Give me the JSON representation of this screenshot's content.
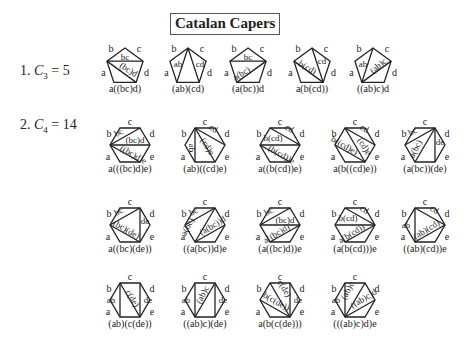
{
  "title": "Catalan Capers",
  "sections": [
    {
      "number": "1.",
      "symbol": "C",
      "subscript": "3",
      "equals": "= 5",
      "y": 70
    },
    {
      "number": "2.",
      "symbol": "C",
      "subscript": "4",
      "equals": "= 14",
      "y": 150
    }
  ],
  "edge_labels": {
    "pentagon": [
      "b",
      "c",
      "d",
      "a"
    ],
    "hexagon": [
      "b",
      "c",
      "d",
      "e",
      "a"
    ]
  },
  "colors": {
    "stroke": "#222222",
    "text": "#222222",
    "background": "#ffffff"
  },
  "pentagons": [
    {
      "cx": 125,
      "cy": 65,
      "caption": "a((bc)d)",
      "diagonals": [
        [
          4,
          1
        ],
        [
          4,
          2
        ]
      ],
      "inner_labels": [
        {
          "text": "bc",
          "x": 125,
          "y": 60,
          "rot": 0
        },
        {
          "text": "(bc)d",
          "x": 127,
          "y": 72,
          "rot": 32
        }
      ]
    },
    {
      "cx": 188,
      "cy": 65,
      "caption": "(ab)(cd)",
      "diagonals": [
        [
          0,
          3
        ],
        [
          0,
          2
        ]
      ],
      "inner_labels": [
        {
          "text": "ab",
          "x": 178,
          "y": 67,
          "rot": 0
        },
        {
          "text": "cd",
          "x": 200,
          "y": 67,
          "rot": 0
        }
      ]
    },
    {
      "cx": 248,
      "cy": 65,
      "caption": "(a(bc))d",
      "diagonals": [
        [
          4,
          1
        ],
        [
          3,
          1
        ]
      ],
      "inner_labels": [
        {
          "text": "bc",
          "x": 248,
          "y": 60,
          "rot": 0
        },
        {
          "text": "a(bc)",
          "x": 243,
          "y": 76,
          "rot": -32
        }
      ]
    },
    {
      "cx": 312,
      "cy": 65,
      "caption": "a(b(cd))",
      "diagonals": [
        [
          4,
          2
        ],
        [
          0,
          2
        ]
      ],
      "inner_labels": [
        {
          "text": "b(cd)",
          "x": 306,
          "y": 70,
          "rot": 30
        },
        {
          "text": "cd",
          "x": 322,
          "y": 64,
          "rot": 0
        }
      ]
    },
    {
      "cx": 373,
      "cy": 65,
      "caption": "((ab)c)d",
      "diagonals": [
        [
          0,
          3
        ],
        [
          3,
          1
        ]
      ],
      "inner_labels": [
        {
          "text": "ab",
          "x": 363,
          "y": 67,
          "rot": 0
        },
        {
          "text": "(ab)c",
          "x": 380,
          "y": 68,
          "rot": -40
        }
      ]
    }
  ],
  "hexagons": [
    {
      "cx": 130,
      "cy": 145,
      "caption": "a(((bc)d)e)",
      "diagonals": [
        [
          5,
          1
        ],
        [
          5,
          2
        ],
        [
          5,
          3
        ]
      ],
      "inner_labels": [
        {
          "text": "bc",
          "x": 120,
          "y": 135,
          "rot": -28
        },
        {
          "text": "(bc)d",
          "x": 135,
          "y": 143,
          "rot": 0
        },
        {
          "text": "((bc)d)e",
          "x": 132,
          "y": 157,
          "rot": 30
        }
      ]
    },
    {
      "cx": 205,
      "cy": 145,
      "caption": "(ab)((cd)e)",
      "diagonals": [
        [
          0,
          2
        ],
        [
          0,
          3
        ],
        [
          0,
          4
        ]
      ],
      "inner_labels": [
        {
          "text": "ab",
          "x": 189,
          "y": 148,
          "rot": 90
        },
        {
          "text": "cd",
          "x": 212,
          "y": 131,
          "rot": 28
        },
        {
          "text": "(cd)e",
          "x": 205,
          "y": 148,
          "rot": 58
        }
      ]
    },
    {
      "cx": 280,
      "cy": 145,
      "caption": "a((b(cd))e)",
      "diagonals": [
        [
          0,
          2
        ],
        [
          5,
          2
        ],
        [
          5,
          3
        ]
      ],
      "inner_labels": [
        {
          "text": "cd",
          "x": 288,
          "y": 131,
          "rot": 28
        },
        {
          "text": "b(cd)",
          "x": 273,
          "y": 141,
          "rot": 0
        },
        {
          "text": "(b(cd))e",
          "x": 280,
          "y": 157,
          "rot": 30
        }
      ]
    },
    {
      "cx": 355,
      "cy": 145,
      "caption": "a(b((cd)e))",
      "diagonals": [
        [
          0,
          2
        ],
        [
          0,
          3
        ],
        [
          5,
          3
        ]
      ],
      "inner_labels": [
        {
          "text": "cd",
          "x": 363,
          "y": 131,
          "rot": 28
        },
        {
          "text": "(cd)e",
          "x": 362,
          "y": 148,
          "rot": 58
        },
        {
          "text": "b((cd)e)",
          "x": 343,
          "y": 148,
          "rot": 30
        }
      ]
    },
    {
      "cx": 425,
      "cy": 145,
      "caption": "(a(bc))(de)",
      "diagonals": [
        [
          5,
          1
        ],
        [
          1,
          4
        ],
        [
          1,
          3
        ]
      ],
      "inner_labels": [
        {
          "text": "bc",
          "x": 414,
          "y": 134,
          "rot": -28
        },
        {
          "text": "a(bc)",
          "x": 418,
          "y": 150,
          "rot": -62
        },
        {
          "text": "de",
          "x": 440,
          "y": 145,
          "rot": 0
        }
      ]
    },
    {
      "cx": 130,
      "cy": 225,
      "caption": "a((bc)(de))",
      "diagonals": [
        [
          5,
          1
        ],
        [
          1,
          3
        ],
        [
          5,
          3
        ]
      ],
      "inner_labels": [
        {
          "text": "bc",
          "x": 120,
          "y": 214,
          "rot": -28
        },
        {
          "text": "de",
          "x": 145,
          "y": 224,
          "rot": 0
        },
        {
          "text": "(bc)(de)",
          "x": 125,
          "y": 232,
          "rot": 30
        }
      ]
    },
    {
      "cx": 205,
      "cy": 225,
      "caption": "((a(bc))d)e",
      "diagonals": [
        [
          5,
          1
        ],
        [
          1,
          4
        ],
        [
          2,
          4
        ]
      ],
      "inner_labels": [
        {
          "text": "bc",
          "x": 195,
          "y": 214,
          "rot": -28
        },
        {
          "text": "a(bc)",
          "x": 190,
          "y": 228,
          "rot": -62
        },
        {
          "text": "(a(bc))d",
          "x": 214,
          "y": 228,
          "rot": -32
        }
      ]
    },
    {
      "cx": 280,
      "cy": 225,
      "caption": "(a((bc)d))e",
      "diagonals": [
        [
          5,
          1
        ],
        [
          5,
          2
        ],
        [
          2,
          4
        ]
      ],
      "inner_labels": [
        {
          "text": "bc",
          "x": 270,
          "y": 214,
          "rot": -28
        },
        {
          "text": "(bc)d",
          "x": 285,
          "y": 223,
          "rot": 0
        },
        {
          "text": "a((bc)d)",
          "x": 278,
          "y": 236,
          "rot": -32
        }
      ]
    },
    {
      "cx": 355,
      "cy": 225,
      "caption": "(a(b(cd)))e",
      "diagonals": [
        [
          0,
          2
        ],
        [
          5,
          2
        ],
        [
          2,
          4
        ]
      ],
      "inner_labels": [
        {
          "text": "cd",
          "x": 363,
          "y": 212,
          "rot": 28
        },
        {
          "text": "b(cd)",
          "x": 348,
          "y": 221,
          "rot": 0
        },
        {
          "text": "a(b(cd))",
          "x": 353,
          "y": 236,
          "rot": -32
        }
      ]
    },
    {
      "cx": 425,
      "cy": 225,
      "caption": "((ab)(cd))e",
      "diagonals": [
        [
          0,
          2
        ],
        [
          0,
          4
        ],
        [
          2,
          4
        ]
      ],
      "inner_labels": [
        {
          "text": "ab",
          "x": 406,
          "y": 228,
          "rot": 0
        },
        {
          "text": "cd",
          "x": 433,
          "y": 212,
          "rot": 28
        },
        {
          "text": "(ab)(cd)",
          "x": 428,
          "y": 232,
          "rot": -32
        }
      ]
    },
    {
      "cx": 130,
      "cy": 300,
      "caption": "(ab)(c(de))",
      "diagonals": [
        [
          0,
          4
        ],
        [
          0,
          3
        ],
        [
          1,
          3
        ]
      ],
      "inner_labels": [
        {
          "text": "ab",
          "x": 111,
          "y": 303,
          "rot": 0
        },
        {
          "text": "c(de)",
          "x": 130,
          "y": 300,
          "rot": 58
        },
        {
          "text": "de",
          "x": 148,
          "y": 303,
          "rot": 0
        }
      ]
    },
    {
      "cx": 205,
      "cy": 300,
      "caption": "((ab)c)(de)",
      "diagonals": [
        [
          0,
          4
        ],
        [
          1,
          4
        ],
        [
          1,
          3
        ]
      ],
      "inner_labels": [
        {
          "text": "ab",
          "x": 186,
          "y": 303,
          "rot": 0
        },
        {
          "text": "(ab)c",
          "x": 205,
          "y": 296,
          "rot": -62
        },
        {
          "text": "de",
          "x": 223,
          "y": 303,
          "rot": 0
        }
      ]
    },
    {
      "cx": 280,
      "cy": 300,
      "caption": "a(b(c(de)))",
      "diagonals": [
        [
          1,
          3
        ],
        [
          0,
          3
        ],
        [
          5,
          3
        ]
      ],
      "inner_labels": [
        {
          "text": "c(de)",
          "x": 282,
          "y": 290,
          "rot": 58
        },
        {
          "text": "b(c(de))",
          "x": 275,
          "y": 304,
          "rot": 30
        },
        {
          "text": "de",
          "x": 298,
          "y": 303,
          "rot": 0
        }
      ]
    },
    {
      "cx": 355,
      "cy": 300,
      "caption": "(((ab)c)d)e",
      "diagonals": [
        [
          0,
          4
        ],
        [
          1,
          4
        ],
        [
          2,
          4
        ]
      ],
      "inner_labels": [
        {
          "text": "ab",
          "x": 336,
          "y": 303,
          "rot": 0
        },
        {
          "text": "(ab)c",
          "x": 350,
          "y": 292,
          "rot": -62
        },
        {
          "text": "((ab)c)d",
          "x": 365,
          "y": 301,
          "rot": -32
        }
      ]
    }
  ]
}
